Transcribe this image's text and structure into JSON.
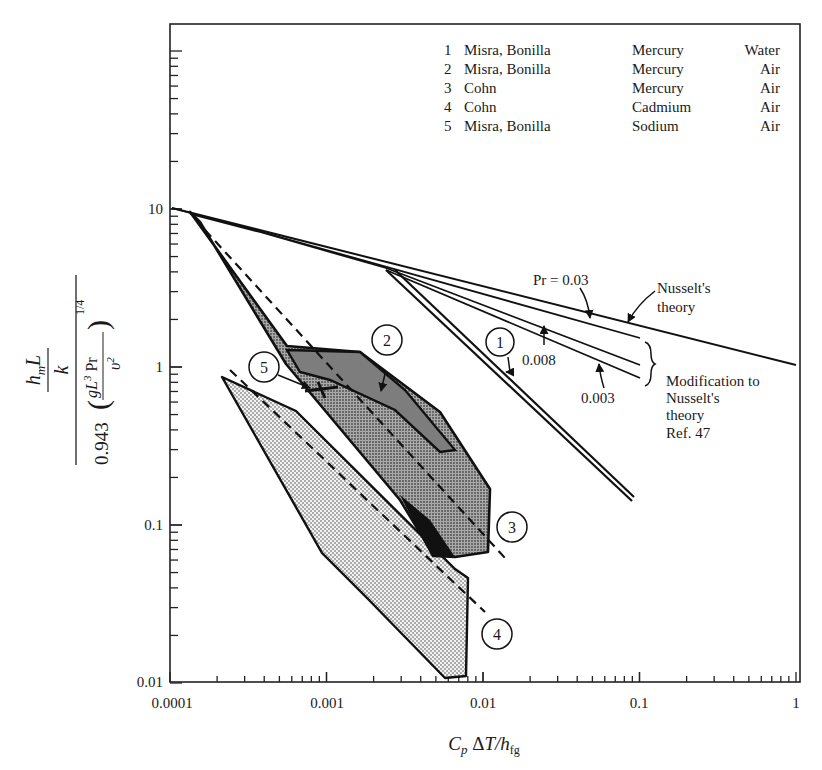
{
  "chart_data": {
    "type": "line",
    "title": "",
    "xlabel": "C_p ΔT/h_fg",
    "ylabel": "(h_m L / k) / [0.943 (g L^3 Pr / ν^2)^(1/4)]",
    "xscale": "log",
    "yscale": "log",
    "xlim": [
      0.0001,
      1
    ],
    "ylim": [
      0.01,
      140
    ],
    "grid": false,
    "x_ticks": [
      "0.0001",
      "0.001",
      "0.01",
      "0.1",
      "1"
    ],
    "y_ticks": [
      "0.01",
      "0.1",
      "1",
      "10"
    ],
    "legend": {
      "position": "upper right",
      "entries": [
        {
          "id": "1",
          "authors": "Misra, Bonilla",
          "metal": "Mercury",
          "gas": "Water"
        },
        {
          "id": "2",
          "authors": "Misra, Bonilla",
          "metal": "Mercury",
          "gas": "Air"
        },
        {
          "id": "3",
          "authors": "Cohn",
          "metal": "Mercury",
          "gas": "Air"
        },
        {
          "id": "4",
          "authors": "Cohn",
          "metal": "Cadmium",
          "gas": "Air"
        },
        {
          "id": "5",
          "authors": "Misra, Bonilla",
          "metal": "Sodium",
          "gas": "Air"
        }
      ]
    },
    "series": [
      {
        "name": "Nusselt's theory",
        "style": "solid",
        "x": [
          0.0001,
          1
        ],
        "y": [
          10,
          1.0
        ]
      },
      {
        "name": "Pr = 0.03",
        "style": "solid",
        "x": [
          0.0001,
          0.0004,
          0.1
        ],
        "y": [
          10,
          7.8,
          1.45
        ]
      },
      {
        "name": "Pr = 0.008",
        "style": "solid",
        "x": [
          0.0001,
          0.0004,
          0.003,
          0.1
        ],
        "y": [
          10,
          7.6,
          4.0,
          1.05
        ]
      },
      {
        "name": "Pr = 0.003",
        "style": "solid",
        "x": [
          0.0001,
          0.0004,
          0.003,
          0.1
        ],
        "y": [
          10,
          7.6,
          3.9,
          0.82
        ]
      },
      {
        "name": "1 Misra, Bonilla Mercury Water",
        "style": "double-line band",
        "x": [
          0.0028,
          0.1
        ],
        "y": [
          3.9,
          0.14
        ]
      },
      {
        "name": "2 Misra, Bonilla Mercury Air (region)",
        "style": "dark-shaded polygon",
        "x": [
          0.00016,
          0.0014,
          0.004,
          0.0075,
          0.0075,
          0.0012,
          0.00017
        ],
        "y": [
          9.3,
          1.35,
          0.55,
          0.3,
          0.28,
          0.7,
          8.5
        ]
      },
      {
        "name": "3 Cohn Mercury Air (region)",
        "style": "dark-shaded polygon with dashed fit",
        "x": [
          0.00016,
          0.0014,
          0.0055,
          0.0105,
          0.011,
          0.0095,
          0.0055,
          0.00017
        ],
        "y": [
          9.3,
          1.35,
          0.55,
          0.29,
          0.12,
          0.065,
          0.065,
          8.5
        ]
      },
      {
        "name": "3 dashed fit",
        "style": "dashed",
        "x": [
          0.00018,
          0.015
        ],
        "y": [
          8.0,
          0.065
        ]
      },
      {
        "name": "4 Cohn Cadmium Air (region)",
        "style": "light-shaded polygon with dashed fit",
        "x": [
          0.00024,
          0.00072,
          0.0075,
          0.0085,
          0.008,
          0.006,
          0.002
        ],
        "y": [
          0.85,
          0.45,
          0.05,
          0.045,
          0.015,
          0.015,
          0.038
        ]
      },
      {
        "name": "4 dashed fit",
        "style": "dashed",
        "x": [
          0.00029,
          0.0095
        ],
        "y": [
          0.95,
          0.028
        ]
      },
      {
        "name": "5 Misra, Bonilla Sodium Air",
        "style": "short bars",
        "x": [
          0.0009,
          0.0014
        ],
        "y": [
          0.72,
          0.78
        ]
      }
    ],
    "annotations": [
      {
        "text": "Pr = 0.03",
        "x": 0.03,
        "y": 3.6
      },
      {
        "text": "0.008",
        "x": 0.013,
        "y": 1.0
      },
      {
        "text": "0.003",
        "x": 0.02,
        "y": 0.56
      },
      {
        "text": "Nusselt's theory",
        "x": 0.13,
        "y": 2.6
      },
      {
        "text": "Modification to Nusselt's theory Ref. 47",
        "x": 0.15,
        "y": 0.75
      },
      {
        "text": "1",
        "x": 0.011,
        "y": 1.6
      },
      {
        "text": "2",
        "x": 0.0024,
        "y": 1.45
      },
      {
        "text": "3",
        "x": 0.016,
        "y": 0.1
      },
      {
        "text": "4",
        "x": 0.012,
        "y": 0.019
      },
      {
        "text": "5",
        "x": 0.0007,
        "y": 0.82
      }
    ]
  },
  "labels": {
    "x_axis": "C_p ΔT/h_fg",
    "y_numer": "h_m L",
    "y_k": "k",
    "y_denom_coeff": "0.943",
    "y_denom_expr": "gL³ Pr",
    "y_denom_nu": "υ²",
    "y_power": "1/4",
    "pr003": "Pr = 0.03",
    "pr0008": "0.008",
    "pr0003": "0.003",
    "nusselt1": "Nusselt's",
    "nusselt2": "theory",
    "mod1": "Modification to",
    "mod2": "Nusselt's",
    "mod3": "theory",
    "mod4": "Ref. 47",
    "c1": "1",
    "c2": "2",
    "c3": "3",
    "c4": "4",
    "c5": "5",
    "xt0": "0.0001",
    "xt1": "0.001",
    "xt2": "0.01",
    "xt3": "0.1",
    "xt4": "1",
    "yt0": "0.01",
    "yt1": "0.1",
    "yt2": "1",
    "yt3": "10"
  },
  "legend_rows": [
    {
      "n": "1",
      "who": "Misra, Bonilla",
      "metal": "Mercury",
      "gas": "Water"
    },
    {
      "n": "2",
      "who": "Misra, Bonilla",
      "metal": "Mercury",
      "gas": "Air"
    },
    {
      "n": "3",
      "who": "Cohn",
      "metal": "Mercury",
      "gas": "Air"
    },
    {
      "n": "4",
      "who": "Cohn",
      "metal": "Cadmium",
      "gas": "Air"
    },
    {
      "n": "5",
      "who": "Misra, Bonilla",
      "metal": "Sodium",
      "gas": "Air"
    }
  ]
}
